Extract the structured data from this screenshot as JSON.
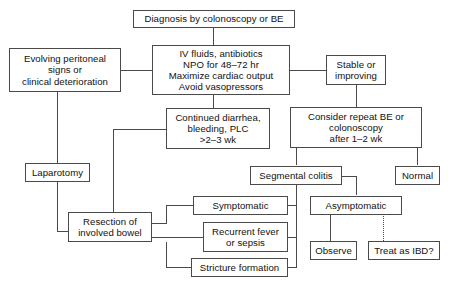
{
  "diagram": {
    "nodes": [
      {
        "id": "diagnosis",
        "label": "Diagnosis by colonoscopy or BE"
      },
      {
        "id": "iv_fluids",
        "label": "IV fluids, antibiotics\nNPO for 48–72 hr\nMaximize cardiac output\nAvoid vasopressors"
      },
      {
        "id": "evolving",
        "label": "Evolving peritoneal\nsigns or\nclinical deterioration"
      },
      {
        "id": "stable",
        "label": "Stable or\nimproving"
      },
      {
        "id": "continued",
        "label": "Continued diarrhea,\nbleeding, PLC\n>2–3 wk"
      },
      {
        "id": "consider_repeat",
        "label": "Consider repeat BE or\ncolonoscopy\nafter 1–2 wk"
      },
      {
        "id": "laparotomy",
        "label": "Laparotomy"
      },
      {
        "id": "segmental",
        "label": "Segmental colitis"
      },
      {
        "id": "normal",
        "label": "Normal"
      },
      {
        "id": "resection",
        "label": "Resection of\ninvolved bowel"
      },
      {
        "id": "symptomatic",
        "label": "Symptomatic"
      },
      {
        "id": "asymptomatic",
        "label": "Asymptomatic"
      },
      {
        "id": "recurrent_fever",
        "label": "Recurrent fever\nor sepsis"
      },
      {
        "id": "stricture",
        "label": "Stricture formation"
      },
      {
        "id": "observe",
        "label": "Observe"
      },
      {
        "id": "treat_ibd",
        "label": "Treat as IBD?"
      }
    ],
    "colors": {
      "line": "#4a4a4a",
      "text": "#111111",
      "background": "#ffffff"
    }
  }
}
